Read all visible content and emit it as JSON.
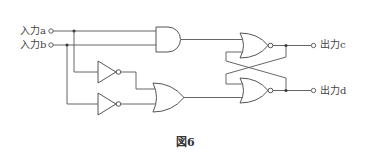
{
  "diagram": {
    "type": "logic-circuit",
    "inputs": [
      {
        "id": "a",
        "label": "入力a"
      },
      {
        "id": "b",
        "label": "入力b"
      }
    ],
    "outputs": [
      {
        "id": "c",
        "label": "出力c"
      },
      {
        "id": "d",
        "label": "出力d"
      }
    ],
    "gates": [
      {
        "id": "and1",
        "type": "AND",
        "inputs": [
          "a",
          "b"
        ]
      },
      {
        "id": "not1",
        "type": "NOT",
        "inputs": [
          "a"
        ]
      },
      {
        "id": "not2",
        "type": "NOT",
        "inputs": [
          "b"
        ]
      },
      {
        "id": "or1",
        "type": "OR",
        "inputs": [
          "not1",
          "not2"
        ]
      },
      {
        "id": "nor1",
        "type": "NOR",
        "inputs": [
          "and1",
          "nor2"
        ],
        "output": "c"
      },
      {
        "id": "nor2",
        "type": "NOR",
        "inputs": [
          "nor1",
          "or1"
        ],
        "output": "d"
      }
    ],
    "caption": "図6"
  },
  "colors": {
    "line": "#555555",
    "background": "#ffffff"
  }
}
